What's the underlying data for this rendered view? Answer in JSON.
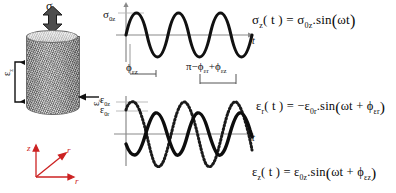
{
  "figure": {
    "background_color": "#ffffff",
    "ink_color": "#111111",
    "axis_color": "#8a8a8a",
    "accent_color": "#cc2222"
  },
  "specimen": {
    "name": "cylindrical-specimen",
    "stress_label": "σ",
    "stress_sub": "z",
    "axial_strain_label": "ε",
    "axial_strain_sub": "z",
    "radial_strain_label": "ε",
    "radial_strain_sub": "r",
    "axes": {
      "vertical": "z",
      "diagonal": "r",
      "horizontal": "r"
    }
  },
  "plots": {
    "stress": {
      "title": "axial stress vs time",
      "y_label": "σ",
      "y_label_sub": "0z",
      "x_label": "t",
      "cycles": 3,
      "phase_deg": 0,
      "amplitude": 1.0,
      "line_style": "solid-thick"
    },
    "strain": {
      "title": "axial and radial strain vs time",
      "y_label_1": "ε",
      "y_label_1_sub": "0z",
      "y_label_2": "ε",
      "y_label_2_sub": "0r",
      "x_label": "t",
      "cycles": 3,
      "series": [
        {
          "name": "εz",
          "line_style": "dotted-thick",
          "amplitude": 1.0,
          "phase_deg": -35,
          "sign": 1
        },
        {
          "name": "εr",
          "line_style": "solid-thick",
          "amplitude": 0.78,
          "phase_deg": -55,
          "sign": -1
        }
      ]
    }
  },
  "annotations": {
    "phi_eps_z": {
      "phi": "ϕ",
      "sub": "εz"
    },
    "pi_minus_phi": {
      "pi": "π",
      "minus": "−",
      "phi1": "ϕ",
      "sub1": "εr",
      "plus": "+",
      "phi2": "ϕ",
      "sub2": "εz"
    }
  },
  "equations": {
    "stress": {
      "lhs_sym": "σ",
      "lhs_sub": "z",
      "arg": "( t )",
      "eq": "=",
      "amp_sym": "σ",
      "amp_sub": "0z",
      "dot": ".",
      "fn": "sin",
      "fn_arg": "ωt"
    },
    "strain_r": {
      "lhs_sym": "ε",
      "lhs_sub": "r",
      "arg": "( t )",
      "eq": "=",
      "sign": "−",
      "amp_sym": "ε",
      "amp_sub": "0r",
      "dot": ".",
      "fn": "sin",
      "fn_arg_1": "ωt",
      "fn_plus": "+",
      "fn_phi": "ϕ",
      "fn_phi_sub": "εr"
    },
    "strain_z": {
      "lhs_sym": "ε",
      "lhs_sub": "z",
      "arg": "( t )",
      "eq": "=",
      "amp_sym": "ε",
      "amp_sub": "0z",
      "dot": ".",
      "fn": "sin",
      "fn_arg_1": "ωt",
      "fn_plus": "+",
      "fn_phi": "ϕ",
      "fn_phi_sub": "εz"
    }
  }
}
